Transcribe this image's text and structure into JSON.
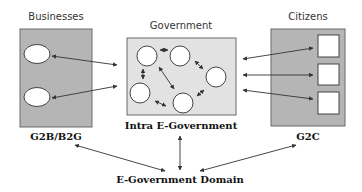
{
  "diagram": {
    "businesses": {
      "title": "Businesses",
      "caption": "G2B/B2G",
      "entities": 2
    },
    "government": {
      "title": "Government",
      "caption": "Intra E-Government",
      "entities": 5
    },
    "citizens": {
      "title": "Citizens",
      "caption": "G2C",
      "entities": 3
    },
    "domain_label": "E-Government Domain",
    "colors": {
      "outer_box": "#b5b5b5",
      "gov_box": "#e2e2e2",
      "border": "#6a6a6a",
      "arrow": "#333333",
      "entity_fill": "#ffffff"
    }
  }
}
